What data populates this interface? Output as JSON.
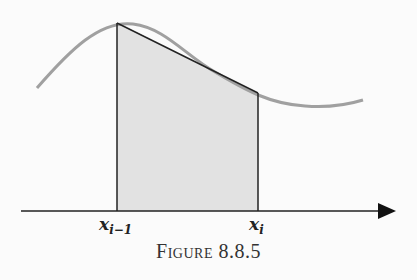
{
  "figure": {
    "caption": "Figure 8.8.5",
    "labels": {
      "left_point": "x",
      "left_sub": "i−1",
      "right_point": "x",
      "right_sub": "i"
    },
    "colors": {
      "curve": "#a0a0a0",
      "trapezoid_fill": "#e2e2e2",
      "trapezoid_edge": "#222222",
      "axis": "#222222"
    }
  }
}
